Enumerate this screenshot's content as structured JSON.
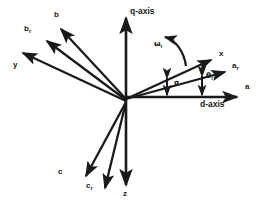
{
  "figure": {
    "background_color": "#ffffff",
    "stroke_color": "#1a1a1a",
    "width": 267,
    "height": 210
  },
  "origin": {
    "x": 126,
    "y": 101
  },
  "axes": [
    {
      "id": "q-axis",
      "label": "q-axis",
      "label_x": 130,
      "label_y": 12,
      "tip_x": 126,
      "tip_y": 14,
      "angle_deg": 90,
      "length": 87
    },
    {
      "id": "d-axis",
      "label": "d-axis",
      "label_x": 203,
      "label_y": 103,
      "tip_x": 241,
      "tip_y": 96,
      "angle_deg": 0,
      "length": 115
    },
    {
      "id": "z-axis",
      "label": "z",
      "label_x": 123,
      "label_y": 192,
      "tip_x": 126,
      "tip_y": 189,
      "angle_deg": -90,
      "length": 88
    }
  ],
  "vectors": [
    {
      "id": "a-axis",
      "label": "a",
      "label_x": 246,
      "label_y": 86,
      "tip_x": 241,
      "tip_y": 96,
      "angle_deg": 0,
      "description": "stator phase a axis, coincident with d-axis direction"
    },
    {
      "id": "ar-axis",
      "label": "a",
      "sub": "r",
      "label_x": 233,
      "label_y": 65,
      "tip_x": 229,
      "tip_y": 70,
      "angle_deg": 10.6,
      "description": "rotor phase a axis"
    },
    {
      "id": "x-axis",
      "label": "x",
      "label_x": 220,
      "label_y": 53,
      "tip_x": 216,
      "tip_y": 57,
      "angle_deg": 24.7,
      "description": "x axis of arbitrary reference frame"
    },
    {
      "id": "b-axis",
      "label": "b",
      "label_x": 55,
      "label_y": 14,
      "tip_x": 56,
      "tip_y": 25,
      "angle_deg": 132.7,
      "description": "stator phase b axis"
    },
    {
      "id": "br-axis",
      "label": "b",
      "sub": "r",
      "label_x": 25,
      "label_y": 27,
      "tip_x": 42,
      "tip_y": 38,
      "angle_deg": 142.0,
      "description": "rotor phase b axis"
    },
    {
      "id": "y-axis",
      "label": "y",
      "label_x": 14,
      "label_y": 64,
      "tip_x": 18,
      "tip_y": 50,
      "angle_deg": 155.7,
      "description": "y axis of arbitrary reference frame"
    },
    {
      "id": "c-axis",
      "label": "c",
      "label_x": 59,
      "label_y": 170,
      "tip_x": 82,
      "tip_y": 180,
      "angle_deg": -116.5,
      "description": "stator phase c axis"
    },
    {
      "id": "cr-axis",
      "label": "c",
      "sub": "r",
      "label_x": 87,
      "label_y": 184,
      "tip_x": 103,
      "tip_y": 193,
      "angle_deg": -103.6,
      "description": "rotor phase c axis"
    }
  ],
  "angle_markers": [
    {
      "id": "alpha",
      "label": "α",
      "label_x": 175,
      "label_y": 82,
      "from_axis": "a-axis",
      "to_axis": "x-axis",
      "marker_x": 167,
      "marker_top_y": 75,
      "marker_bottom_y": 98,
      "description": "angle between a-axis (d-axis) and x-axis"
    },
    {
      "id": "theta-r",
      "label": "θ",
      "sub": "r",
      "label_x": 207,
      "label_y": 76,
      "from_axis": "a-axis",
      "to_axis": "ar-axis",
      "marker_x": 202,
      "marker_top_y": 73,
      "marker_bottom_y": 98,
      "description": "rotor angular position between a-axis and a_r axis"
    }
  ],
  "rotation": {
    "id": "omega-r",
    "label": "ω",
    "sub": "r",
    "label_x": 155,
    "label_y": 43,
    "arc_start_x": 186,
    "arc_start_y": 66,
    "arc_end_x": 162,
    "arc_end_y": 36,
    "direction": "counter-clockwise",
    "description": "rotor angular speed"
  }
}
